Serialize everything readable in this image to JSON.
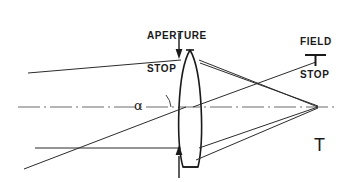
{
  "diagram": {
    "labels": {
      "aperture_stop_line1": "APERTURE",
      "aperture_stop_line2": "STOP",
      "field_stop_line1": "FIELD",
      "field_stop_line2": "STOP",
      "angle_symbol": "α",
      "corner_marker": "T"
    },
    "colors": {
      "ink": "#1a1a1a",
      "ray": "#2b2b2b",
      "background": "#ffffff"
    },
    "elements": {
      "lens": "biconvex-lens",
      "optical_axis": "dash-dot-centerline",
      "aperture_arrow_top": "down-arrow",
      "aperture_arrow_bottom": "up-arrow",
      "field_stop_marker": "tee-marker",
      "focal_point": "ray-convergence-point"
    },
    "geometry": {
      "lens_center_x": 190,
      "lens_top_y": 50,
      "lens_bottom_y": 167,
      "focal_point_x": 318,
      "focal_point_y": 107,
      "field_stop_x": 315,
      "field_stop_y": 62,
      "axis_start_x": 18,
      "axis_end_x": 334
    }
  }
}
